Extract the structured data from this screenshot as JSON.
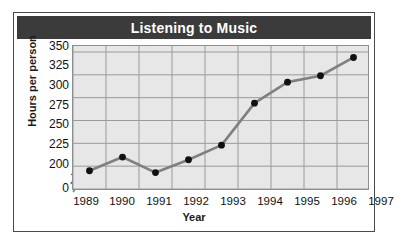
{
  "title": "Listening to Music",
  "axes": {
    "xlabel": "Year",
    "ylabel": "Hours per person",
    "yticks": [
      "350",
      "325",
      "300",
      "275",
      "250",
      "225",
      "200",
      "0"
    ],
    "xticks": [
      "1989",
      "1990",
      "1991",
      "1992",
      "1993",
      "1994",
      "1995",
      "1996",
      "1997"
    ]
  },
  "colors": {
    "title_bar": "#3b3b3b",
    "title_text": "#ffffff",
    "plot_background": "#e7e7e7",
    "gridline": "#9a9a9a",
    "line": "#808080",
    "marker": "#111111",
    "frame": "#4a4a4a"
  },
  "chart_data": {
    "type": "line",
    "title": "Listening to Music",
    "xlabel": "Year",
    "ylabel": "Hours per person",
    "categories": [
      "1989",
      "1990",
      "1991",
      "1992",
      "1993",
      "1994",
      "1995",
      "1996",
      "1997"
    ],
    "values": [
      220,
      235,
      218,
      232,
      248,
      294,
      317,
      324,
      344
    ],
    "series": [
      {
        "name": "Hours per person",
        "values": [
          220,
          235,
          218,
          232,
          248,
          294,
          317,
          324,
          344
        ]
      }
    ],
    "ylim": [
      200,
      350
    ],
    "yticks": [
      200,
      225,
      250,
      275,
      300,
      325,
      350
    ],
    "y_axis_break": true,
    "y_axis_break_label": "0",
    "grid": true,
    "legend": false,
    "markers": "circle"
  }
}
